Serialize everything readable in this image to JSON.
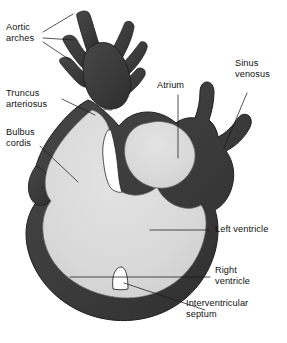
{
  "figure": {
    "colors": {
      "wall": "#3c3c3c",
      "wall_shadow": "#2e2e2e",
      "lumen": "#d7d7d7",
      "lumen_highlight": "#e2e2e2",
      "background": "#ffffff",
      "outline": "#1a1a1a",
      "leader_line": "#1a1a1a",
      "text": "#111111"
    }
  },
  "labels": {
    "aortic_arches": "Aortic\narches",
    "truncus_arteriosus": "Truncus\narteriosus",
    "bulbus_cordis": "Bulbus\ncordis",
    "atrium": "Atrium",
    "sinus_venosus": "Sinus\nvenosus",
    "left_ventricle": "Left ventricle",
    "right_ventricle": "Right\nventricle",
    "interventricular_septum": "Interventricular\nseptum"
  },
  "structures": [
    {
      "name": "aortic-arches",
      "label": "Aortic arches",
      "region": "top-left branches"
    },
    {
      "name": "truncus-arteriosus",
      "label": "Truncus arteriosus",
      "region": "upper stem"
    },
    {
      "name": "bulbus-cordis",
      "label": "Bulbus cordis",
      "region": "left chamber"
    },
    {
      "name": "atrium",
      "label": "Atrium",
      "region": "upper right chamber"
    },
    {
      "name": "sinus-venosus",
      "label": "Sinus venosus",
      "region": "right inflow"
    },
    {
      "name": "left-ventricle",
      "label": "Left ventricle",
      "region": "lower right chamber"
    },
    {
      "name": "right-ventricle",
      "label": "Right ventricle",
      "region": "lower left chamber"
    },
    {
      "name": "interventricular-septum",
      "label": "Interventricular septum",
      "region": "bottom ridge"
    }
  ]
}
